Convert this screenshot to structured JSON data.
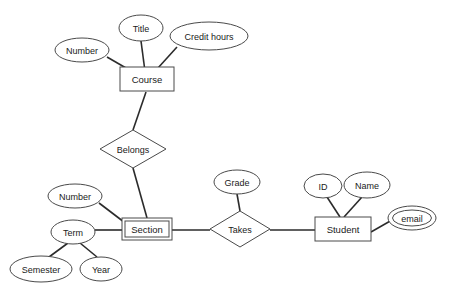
{
  "diagram": {
    "type": "entity-relationship-diagram",
    "colors": {
      "shape_stroke": "#4a4a4a",
      "line_stroke": "#2b2b2b",
      "shape_fill": "#ffffff",
      "text": "#1a1a1a",
      "background": "#ffffff"
    },
    "entities": [
      {
        "id": "course",
        "label": "Course",
        "kind": "strong-entity",
        "x": 147,
        "y": 79,
        "w": 54,
        "h": 24
      },
      {
        "id": "section",
        "label": "Section",
        "kind": "weak-entity",
        "x": 147,
        "y": 229,
        "w": 50,
        "h": 22
      },
      {
        "id": "student",
        "label": "Student",
        "kind": "strong-entity",
        "x": 343,
        "y": 229,
        "w": 56,
        "h": 24
      }
    ],
    "relationships": [
      {
        "id": "belongs",
        "label": "Belongs",
        "kind": "identifying-relationship",
        "x": 133,
        "y": 149,
        "rx": 33,
        "ry": 19
      },
      {
        "id": "takes",
        "label": "Takes",
        "kind": "relationship",
        "x": 240,
        "y": 229,
        "rx": 30,
        "ry": 18
      }
    ],
    "attributes": [
      {
        "id": "course-title",
        "label": "Title",
        "kind": "attribute",
        "owner": "course",
        "x": 141,
        "y": 28,
        "rx": 22,
        "ry": 13
      },
      {
        "id": "course-credit-hours",
        "label": "Credit hours",
        "kind": "attribute",
        "owner": "course",
        "x": 209,
        "y": 36,
        "rx": 39,
        "ry": 14
      },
      {
        "id": "course-number",
        "label": "Number",
        "kind": "attribute",
        "owner": "course",
        "x": 82,
        "y": 50,
        "rx": 27,
        "ry": 12
      },
      {
        "id": "section-number",
        "label": "Number",
        "kind": "attribute",
        "owner": "section",
        "x": 75,
        "y": 196,
        "rx": 27,
        "ry": 12
      },
      {
        "id": "section-term",
        "label": "Term",
        "kind": "composite-attribute",
        "owner": "section",
        "x": 73,
        "y": 232,
        "rx": 22,
        "ry": 12
      },
      {
        "id": "term-semester",
        "label": "Semester",
        "kind": "attribute",
        "owner": "section-term",
        "x": 41,
        "y": 269,
        "rx": 31,
        "ry": 13
      },
      {
        "id": "term-year",
        "label": "Year",
        "kind": "attribute",
        "owner": "section-term",
        "x": 101,
        "y": 269,
        "rx": 21,
        "ry": 12
      },
      {
        "id": "takes-grade",
        "label": "Grade",
        "kind": "attribute",
        "owner": "takes",
        "x": 237,
        "y": 182,
        "rx": 23,
        "ry": 12
      },
      {
        "id": "student-id",
        "label": "ID",
        "kind": "attribute",
        "owner": "student",
        "x": 323,
        "y": 186,
        "rx": 19,
        "ry": 12
      },
      {
        "id": "student-name",
        "label": "Name",
        "kind": "attribute",
        "owner": "student",
        "x": 367,
        "y": 185,
        "rx": 23,
        "ry": 13
      },
      {
        "id": "student-email",
        "label": "email",
        "kind": "multivalued-attribute",
        "owner": "student",
        "x": 412,
        "y": 218,
        "rx": 24,
        "ry": 12
      }
    ],
    "connectors": [
      {
        "from": "course-title",
        "to": "course",
        "x1": 141,
        "y1": 41,
        "x2": 146,
        "y2": 79
      },
      {
        "from": "course-credit-hours",
        "to": "course",
        "x1": 177,
        "y1": 47,
        "x2": 148,
        "y2": 79
      },
      {
        "from": "course-number",
        "to": "course",
        "x1": 107,
        "y1": 57,
        "x2": 145,
        "y2": 79
      },
      {
        "from": "course",
        "to": "belongs",
        "x1": 146,
        "y1": 92,
        "x2": 133,
        "y2": 130
      },
      {
        "from": "belongs",
        "to": "section",
        "x1": 133,
        "y1": 168,
        "x2": 147,
        "y2": 218
      },
      {
        "from": "section-number",
        "to": "section",
        "x1": 99,
        "y1": 203,
        "x2": 124,
        "y2": 222
      },
      {
        "from": "section-term",
        "to": "section",
        "x1": 95,
        "y1": 230,
        "x2": 122,
        "y2": 230
      },
      {
        "from": "section-term",
        "to": "term-semester",
        "x1": 68,
        "y1": 243,
        "x2": 49,
        "y2": 257
      },
      {
        "from": "section-term",
        "to": "term-year",
        "x1": 80,
        "y1": 243,
        "x2": 97,
        "y2": 257
      },
      {
        "from": "section",
        "to": "takes",
        "x1": 172,
        "y1": 230,
        "x2": 210,
        "y2": 230
      },
      {
        "from": "takes-grade",
        "to": "takes",
        "x1": 237,
        "y1": 194,
        "x2": 240,
        "y2": 211
      },
      {
        "from": "takes",
        "to": "student",
        "x1": 270,
        "y1": 230,
        "x2": 315,
        "y2": 230
      },
      {
        "from": "student-id",
        "to": "student",
        "x1": 327,
        "y1": 197,
        "x2": 340,
        "y2": 217
      },
      {
        "from": "student-name",
        "to": "student",
        "x1": 362,
        "y1": 197,
        "x2": 344,
        "y2": 217
      },
      {
        "from": "student",
        "to": "student-email",
        "x1": 371,
        "y1": 232,
        "x2": 392,
        "y2": 220
      }
    ]
  }
}
